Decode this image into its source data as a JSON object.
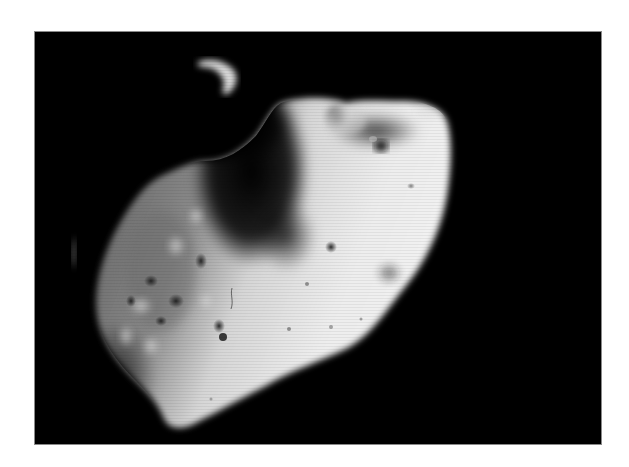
{
  "image": {
    "subject": "asteroid",
    "kind": "grayscale photograph",
    "alt": "Black-and-white photograph of an irregularly shaped, cratered asteroid against a black background"
  },
  "colors": {
    "page_background": "#ffffff",
    "space_background": "#000000",
    "frame_border": "#8a8a8a",
    "lit_surface": "#e8e8e8",
    "mid_surface": "#8c8c8c",
    "shadow_surface": "#3a3a3a"
  }
}
